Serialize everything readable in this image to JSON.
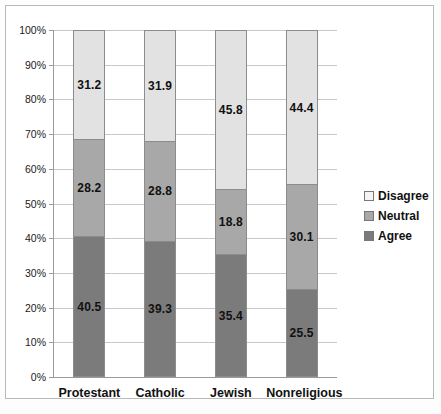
{
  "chart_data": {
    "type": "bar",
    "stacked": true,
    "title": "",
    "xlabel": "",
    "ylabel": "",
    "ylim": [
      0,
      100
    ],
    "ytick_labels": [
      "0%",
      "10%",
      "20%",
      "30%",
      "40%",
      "50%",
      "60%",
      "70%",
      "80%",
      "90%",
      "100%"
    ],
    "ytick_values": [
      0,
      10,
      20,
      30,
      40,
      50,
      60,
      70,
      80,
      90,
      100
    ],
    "grid": true,
    "legend_position": "right",
    "categories": [
      "Protestant",
      "Catholic",
      "Jewish",
      "Nonreligious"
    ],
    "series": [
      {
        "name": "Agree",
        "color": "#7b7b7b",
        "values": [
          40.5,
          39.3,
          35.4,
          25.5
        ]
      },
      {
        "name": "Neutral",
        "color": "#a8a8a8",
        "values": [
          28.2,
          28.8,
          18.8,
          30.1
        ]
      },
      {
        "name": "Disagree",
        "color": "#e2e2e2",
        "values": [
          31.2,
          31.9,
          45.8,
          44.4
        ]
      }
    ]
  },
  "legend": {
    "items": [
      {
        "label": "Disagree",
        "swatch": "disagree"
      },
      {
        "label": "Neutral",
        "swatch": "neutral"
      },
      {
        "label": "Agree",
        "swatch": "agree"
      }
    ]
  }
}
